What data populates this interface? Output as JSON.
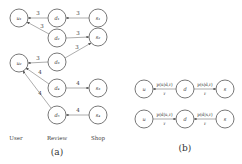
{
  "panel_a": {
    "caption": "(a)",
    "columns": [
      "User",
      "Review",
      "Shop"
    ],
    "nodes": [
      {
        "id": "u1",
        "label": "u₁"
      },
      {
        "id": "u2",
        "label": "u₂"
      },
      {
        "id": "d1",
        "label": "d₁"
      },
      {
        "id": "d2",
        "label": "d₂"
      },
      {
        "id": "d3",
        "label": "d₃"
      },
      {
        "id": "d4",
        "label": "d₄"
      },
      {
        "id": "d5",
        "label": "d₅"
      },
      {
        "id": "s1",
        "label": "s₁"
      },
      {
        "id": "s2",
        "label": "s₂"
      },
      {
        "id": "s3",
        "label": "s₃"
      },
      {
        "id": "s4",
        "label": "s₄"
      }
    ],
    "edges": [
      {
        "from": "d1",
        "to": "u1",
        "weight": "3"
      },
      {
        "from": "s1",
        "to": "d1",
        "weight": "3"
      },
      {
        "from": "d2",
        "to": "u1",
        "weight": "3"
      },
      {
        "from": "d2",
        "to": "s2",
        "weight": "3"
      },
      {
        "from": "d3",
        "to": "u2",
        "weight": "3"
      },
      {
        "from": "d3",
        "to": "s2",
        "weight": "3"
      },
      {
        "from": "d4",
        "to": "u2",
        "weight": "4"
      },
      {
        "from": "d4",
        "to": "s3",
        "weight": "4"
      },
      {
        "from": "d5",
        "to": "u2",
        "weight": "4"
      },
      {
        "from": "s4",
        "to": "d5",
        "weight": "4"
      }
    ]
  },
  "panel_b": {
    "caption": "(b)",
    "rows": [
      {
        "nodes": [
          "u",
          "d",
          "s"
        ],
        "edges": [
          {
            "label_top": "p(u|d,r)",
            "label_bottom": "r",
            "direction": "d→u"
          },
          {
            "label_top": "p(s|d,r)",
            "label_bottom": "r",
            "direction": "d→s"
          }
        ]
      },
      {
        "nodes": [
          "u",
          "d",
          "s"
        ],
        "edges": [
          {
            "label_top": "p(d|u,r)",
            "label_bottom": "r",
            "direction": "u→d"
          },
          {
            "label_top": "p(d|s,r)",
            "label_bottom": "r",
            "direction": "s→d"
          }
        ]
      }
    ]
  }
}
